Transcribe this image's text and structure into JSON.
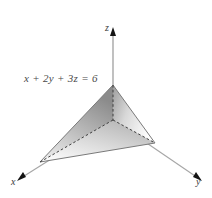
{
  "figure": {
    "equation_label": "x + 2y + 3z = 6",
    "background_color": "#ffffff",
    "axes": [
      {
        "name": "x-axis",
        "label": "x",
        "direction": "down-left",
        "arrow": true
      },
      {
        "name": "y-axis",
        "label": "y",
        "direction": "down-right",
        "arrow": true
      },
      {
        "name": "z-axis",
        "label": "z",
        "direction": "up",
        "arrow": true
      }
    ],
    "colors": {
      "axis_line": "#9a9a9a",
      "arrow_fill": "#1a1a1a",
      "edge_line": "#6a6a6a",
      "hidden_edge": "#3a3a3a",
      "face_left_light": "#f2f2f2",
      "face_left_dark": "#8d8d8d",
      "face_right_light": "#fbfbfb",
      "face_right_dark": "#a8a8a8",
      "face_bottom_light": "#fafafa",
      "face_bottom_dark": "#b4b4b4",
      "text": "#4a4a4a"
    },
    "geometry": {
      "origin": [
        113,
        120
      ],
      "z_intercept": [
        113,
        85
      ],
      "x_intercept": [
        40,
        162
      ],
      "y_intercept": [
        155,
        143
      ],
      "z_axis_top": [
        113,
        28
      ],
      "x_axis_end": [
        18,
        180
      ],
      "y_axis_end": [
        200,
        180
      ]
    },
    "hidden_edges": [
      {
        "name": "origin-to-z-intercept",
        "from": [
          113,
          120
        ],
        "to": [
          113,
          85
        ]
      },
      {
        "name": "origin-to-x-intercept",
        "from": [
          113,
          120
        ],
        "to": [
          40,
          162
        ]
      },
      {
        "name": "origin-to-y-intercept",
        "from": [
          113,
          120
        ],
        "to": [
          155,
          143
        ]
      }
    ]
  }
}
